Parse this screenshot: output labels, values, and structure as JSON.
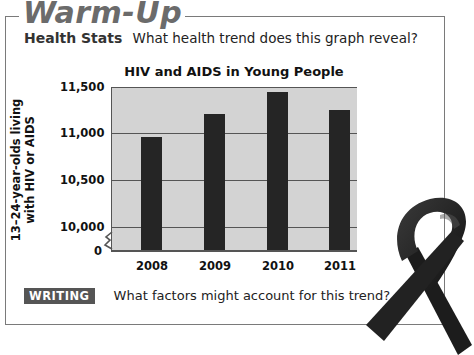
{
  "header": {
    "title": "Warm-Up"
  },
  "prompt": {
    "label": "Health Stats",
    "question": "What health trend does this graph reveal?"
  },
  "writing": {
    "badge": "WRITING",
    "question": "What factors might account for this trend?"
  },
  "decoration": {
    "icon": "awareness-ribbon-icon",
    "color": "#1f1f1f"
  },
  "colors": {
    "plot_background": "#d3d3d3",
    "bar": "#252525",
    "frame": "#7a7a7a",
    "title": "#6b6b6b"
  },
  "chart_data": {
    "type": "bar",
    "title": "HIV and AIDS in Young People",
    "xlabel": "",
    "ylabel": "13–24-year-olds living with HIV or AIDS",
    "categories": [
      "2008",
      "2009",
      "2010",
      "2011"
    ],
    "values": [
      10975,
      11220,
      11460,
      11270
    ],
    "y_ticks": [
      "0",
      "10,000",
      "10,500",
      "11,000",
      "11,500"
    ],
    "ylim": [
      10000,
      11500
    ],
    "axis_break": true,
    "grid": true,
    "legend": null
  }
}
